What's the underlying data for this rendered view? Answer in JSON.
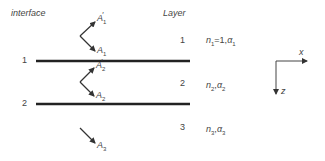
{
  "headers": {
    "interface": "interface",
    "layer": "Layer"
  },
  "interfaces": [
    {
      "label": "1"
    },
    {
      "label": "2"
    }
  ],
  "layers": [
    {
      "number": "1",
      "n": "n",
      "n_sub": "1",
      "eq": "=1,",
      "alpha": "α",
      "alpha_sub": "1"
    },
    {
      "number": "2",
      "n": "n",
      "n_sub": "2",
      "sep": ",",
      "alpha": "α",
      "alpha_sub": "2"
    },
    {
      "number": "3",
      "n": "n",
      "n_sub": "3",
      "sep": ",",
      "alpha": "α",
      "alpha_sub": "3"
    }
  ],
  "amplitudes": {
    "a1p": {
      "sym": "A",
      "sub": "1",
      "prime": "′"
    },
    "a1": {
      "sym": "A",
      "sub": "1"
    },
    "a2p": {
      "sym": "A",
      "sub": "2",
      "prime": "′"
    },
    "a2": {
      "sym": "A",
      "sub": "2"
    },
    "a3": {
      "sym": "A",
      "sub": "3"
    }
  },
  "axes": {
    "x": "x",
    "z": "z"
  },
  "colors": {
    "line": "#222222",
    "text": "#444444"
  }
}
